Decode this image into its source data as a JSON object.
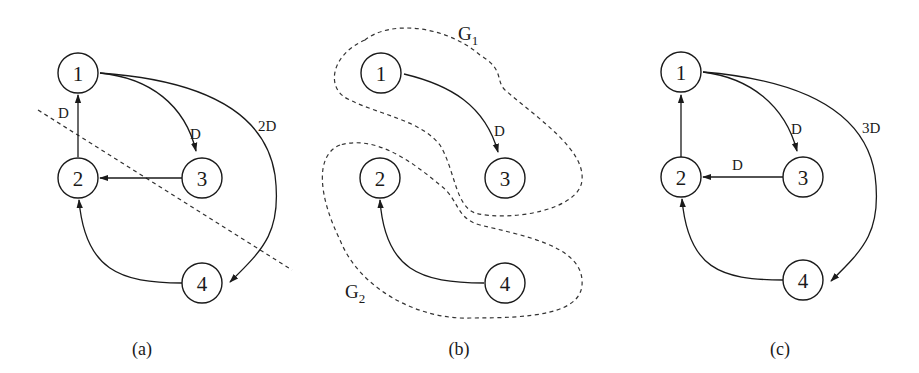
{
  "figure": {
    "panels": [
      {
        "id": "a",
        "caption": "(a)",
        "nodes": [
          {
            "label": "1"
          },
          {
            "label": "2"
          },
          {
            "label": "3"
          },
          {
            "label": "4"
          }
        ],
        "edges": [
          {
            "from": "2",
            "to": "1",
            "label": "D"
          },
          {
            "from": "1",
            "to": "3",
            "label": "D"
          },
          {
            "from": "1",
            "to": "4",
            "label": "2D"
          },
          {
            "from": "3",
            "to": "2",
            "label": ""
          },
          {
            "from": "4",
            "to": "2",
            "label": ""
          }
        ],
        "cut_line": "dashed diagonal separating {1,3} from {2,4}"
      },
      {
        "id": "b",
        "caption": "(b)",
        "groups": [
          {
            "label": "G",
            "subscript": "1",
            "nodes": [
              "1",
              "3"
            ]
          },
          {
            "label": "G",
            "subscript": "2",
            "nodes": [
              "2",
              "4"
            ]
          }
        ],
        "nodes": [
          {
            "label": "1"
          },
          {
            "label": "2"
          },
          {
            "label": "3"
          },
          {
            "label": "4"
          }
        ],
        "edges": [
          {
            "from": "1",
            "to": "3",
            "label": "D"
          },
          {
            "from": "4",
            "to": "2",
            "label": ""
          }
        ]
      },
      {
        "id": "c",
        "caption": "(c)",
        "nodes": [
          {
            "label": "1"
          },
          {
            "label": "2"
          },
          {
            "label": "3"
          },
          {
            "label": "4"
          }
        ],
        "edges": [
          {
            "from": "2",
            "to": "1",
            "label": ""
          },
          {
            "from": "1",
            "to": "3",
            "label": "D"
          },
          {
            "from": "1",
            "to": "4",
            "label": "3D"
          },
          {
            "from": "3",
            "to": "2",
            "label": "D"
          },
          {
            "from": "4",
            "to": "2",
            "label": ""
          }
        ]
      }
    ]
  }
}
